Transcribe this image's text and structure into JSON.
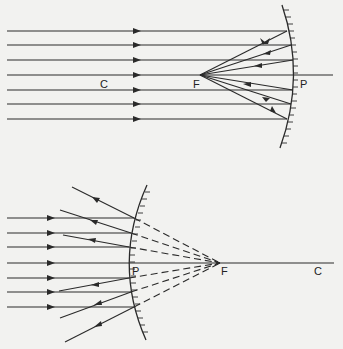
{
  "diagrams": [
    {
      "name": "concave-mirror",
      "labels": {
        "center": "C",
        "focus": "F",
        "pole": "P"
      },
      "description": "Parallel rays reflected by concave mirror converge at focus F"
    },
    {
      "name": "convex-mirror",
      "labels": {
        "pole": "P",
        "focus": "F",
        "center": "C"
      },
      "description": "Parallel rays reflected by convex mirror appear to diverge from virtual focus F"
    }
  ],
  "colors": {
    "ink": "#2a2a2a",
    "background": "#f2f2f0"
  }
}
